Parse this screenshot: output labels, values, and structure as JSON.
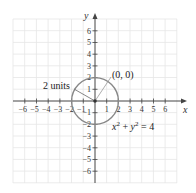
{
  "diagram": {
    "type": "coordinate-plane-circle",
    "axes": {
      "x_label": "x",
      "y_label": "y",
      "x_ticks": [
        "−6",
        "−5",
        "−4",
        "−3",
        "−2",
        "−1",
        "1",
        "2",
        "3",
        "4",
        "5",
        "6"
      ],
      "y_ticks_pos": [
        "6",
        "5",
        "4",
        "3",
        "2",
        "1"
      ],
      "y_ticks_neg": [
        "−1",
        "−2",
        "−3",
        "−4",
        "−5",
        "−6"
      ],
      "range": [
        -7,
        7
      ]
    },
    "circle": {
      "center": [
        0,
        0
      ],
      "radius": 2,
      "color": "#888888"
    },
    "annotations": {
      "center_label": "(0, 0)",
      "radius_label": "2 units",
      "equation_x": "x",
      "equation_sup1": "2",
      "equation_plus": " + ",
      "equation_y": "y",
      "equation_sup2": "2",
      "equation_rhs": " = 4"
    }
  }
}
